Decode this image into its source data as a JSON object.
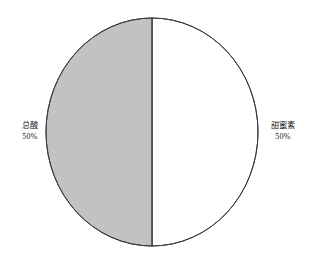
{
  "chart_data": {
    "type": "pie",
    "title": "",
    "subtitle": "",
    "xlabel": "",
    "ylabel": "",
    "legend_position": "none",
    "grid": false,
    "labels_inline": true,
    "categories": [
      "总酸",
      "甜蜜素"
    ],
    "values": [
      50,
      50
    ],
    "value_suffix": "%",
    "slices": [
      {
        "name": "总酸",
        "value": 50,
        "value_label": "50%",
        "color": "#c2c2c2",
        "side": "left",
        "start_angle_deg": 180,
        "end_angle_deg": 360
      },
      {
        "name": "甜蜜素",
        "value": 50,
        "value_label": "50%",
        "color": "#ffffff",
        "side": "right",
        "start_angle_deg": 0,
        "end_angle_deg": 180
      }
    ]
  },
  "colors": {
    "background": "#ffffff",
    "outline": "#3b3b3b",
    "divider": "#3b3b3b",
    "slice_gray": "#c2c2c2",
    "slice_white": "#ffffff",
    "text": "#1a1a1a"
  },
  "geometry": {
    "center_x": 152,
    "center_y": 132,
    "radius_x": 106,
    "radius_y": 114
  }
}
